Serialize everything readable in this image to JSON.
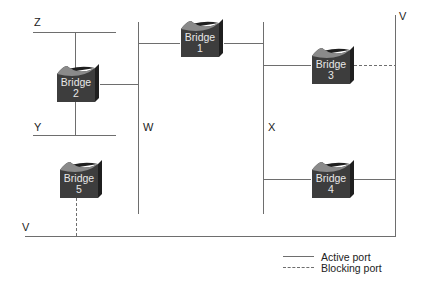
{
  "segments": [
    {
      "id": "Z",
      "label": "Z"
    },
    {
      "id": "Y",
      "label": "Y"
    },
    {
      "id": "W",
      "label": "W"
    },
    {
      "id": "X",
      "label": "X"
    },
    {
      "id": "V-right",
      "label": "V"
    },
    {
      "id": "V-bottom",
      "label": "V"
    }
  ],
  "bridges": [
    {
      "id": 1,
      "label": "Bridge",
      "number": "1",
      "ports": {
        "W": "active",
        "X": "active"
      }
    },
    {
      "id": 2,
      "label": "Bridge",
      "number": "2",
      "ports": {
        "Z": "active",
        "Y": "active",
        "W": "active"
      }
    },
    {
      "id": 3,
      "label": "Bridge",
      "number": "3",
      "ports": {
        "X": "active",
        "V": "blocking"
      }
    },
    {
      "id": 4,
      "label": "Bridge",
      "number": "4",
      "ports": {
        "X": "active",
        "V": "active"
      }
    },
    {
      "id": 5,
      "label": "Bridge",
      "number": "5",
      "ports": {
        "V": "blocking"
      }
    }
  ],
  "legend": {
    "active": "Active port",
    "blocking": "Blocking port"
  },
  "colors": {
    "line": "#6e6e6e",
    "bridge_face": "#3d3d3d",
    "bridge_top": "#8a8a8a",
    "bridge_side": "#1f1f1f",
    "bridge_text": "#e8e8e8"
  }
}
